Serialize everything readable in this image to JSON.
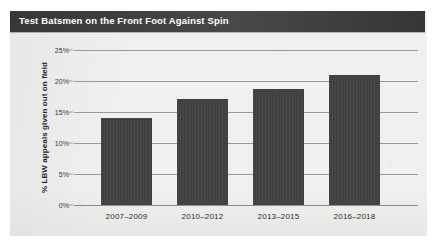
{
  "chart_data": {
    "type": "bar",
    "title": "Test Batsmen on the Front Foot Against Spin",
    "xlabel": "",
    "ylabel": "% LBW appeals given out on field",
    "categories": [
      "2007–2009",
      "2010–2012",
      "2013–2015",
      "2016–2018"
    ],
    "values": [
      14.0,
      17.1,
      18.7,
      21.0
    ],
    "ylim": [
      0,
      25
    ],
    "ytick_labels": [
      "0%",
      "5%",
      "10%",
      "15%",
      "20%",
      "25%"
    ],
    "ytick_values": [
      0,
      5,
      10,
      15,
      20,
      25
    ],
    "grid": "horizontal",
    "legend": "none",
    "series": [
      {
        "name": "% LBW appeals given out on field",
        "values": [
          14.0,
          17.1,
          18.7,
          21.0
        ]
      }
    ]
  },
  "colors": {
    "bar_fill": "#3d3d3d",
    "title_bar": "#2f2f2f",
    "title_text": "#ffffff",
    "panel_background": "#f0f0ee",
    "gridline": "#9a9a96",
    "axis_text": "#2c2c30",
    "page_background": "#ffffff"
  }
}
